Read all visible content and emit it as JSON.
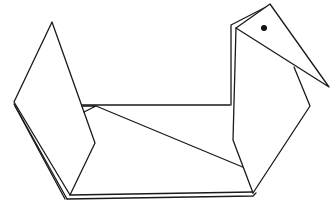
{
  "figure": {
    "colors": {
      "background": "#ffffff",
      "stroke": "#1a1a1a",
      "eye": "#111111"
    }
  }
}
